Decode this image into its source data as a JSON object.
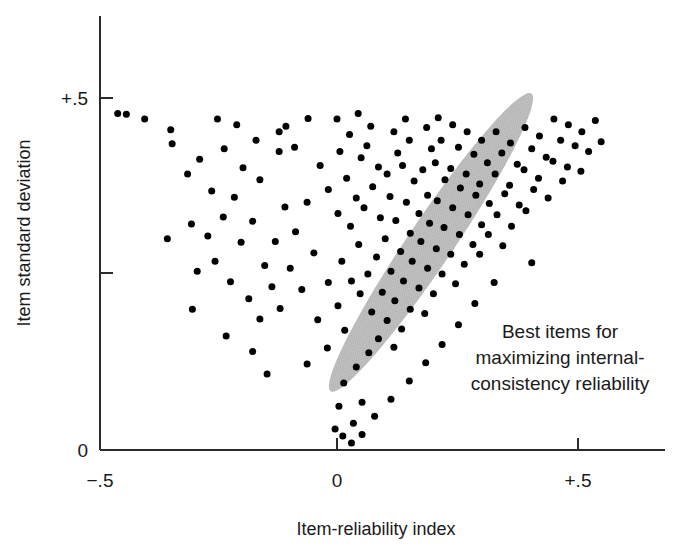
{
  "chart_data": {
    "type": "scatter",
    "title": "",
    "xlabel": "Item-reliability index",
    "ylabel": "Item standard deviation",
    "xlim": [
      -0.5,
      0.68
    ],
    "ylim": [
      0.0,
      0.59
    ],
    "x_ticks": [
      {
        "value": -0.5,
        "label": "−.5"
      },
      {
        "value": 0.0,
        "label": "0"
      },
      {
        "value": 0.5,
        "label": "+.5"
      }
    ],
    "y_ticks": [
      {
        "value": 0.0,
        "label": "0"
      },
      {
        "value": 0.25,
        "label": ""
      },
      {
        "value": 0.5,
        "label": "+.5"
      }
    ],
    "grid": false,
    "legend": null,
    "annotations": [
      {
        "name": "best-items-callout",
        "lines": [
          "Best items for",
          "maximizing internal-",
          "consistency reliability"
        ],
        "x": 0.47,
        "y": 0.165
      }
    ],
    "highlight_region": {
      "shape": "ellipse",
      "name": "best-items-ellipse",
      "fill": "#bdbdbd",
      "center_x": 0.195,
      "center_y": 0.295,
      "semi_major": 0.255,
      "semi_minor": 0.047,
      "rotation_deg": -56
    },
    "marker": {
      "shape": "circle",
      "color": "#000000",
      "size_px": 7
    },
    "points": [
      [
        -0.455,
        0.478
      ],
      [
        -0.437,
        0.477
      ],
      [
        -0.399,
        0.47
      ],
      [
        -0.345,
        0.455
      ],
      [
        -0.342,
        0.435
      ],
      [
        -0.285,
        0.413
      ],
      [
        -0.234,
        0.428
      ],
      [
        -0.195,
        0.401
      ],
      [
        -0.26,
        0.368
      ],
      [
        -0.213,
        0.359
      ],
      [
        -0.16,
        0.384
      ],
      [
        -0.12,
        0.424
      ],
      [
        -0.106,
        0.46
      ],
      [
        -0.088,
        0.43
      ],
      [
        -0.06,
        0.471
      ],
      [
        -0.302,
        0.321
      ],
      [
        -0.268,
        0.304
      ],
      [
        -0.236,
        0.331
      ],
      [
        -0.199,
        0.295
      ],
      [
        -0.175,
        0.325
      ],
      [
        -0.15,
        0.262
      ],
      [
        -0.128,
        0.296
      ],
      [
        -0.108,
        0.345
      ],
      [
        -0.086,
        0.31
      ],
      [
        -0.062,
        0.352
      ],
      [
        -0.29,
        0.254
      ],
      [
        -0.253,
        0.268
      ],
      [
        -0.221,
        0.239
      ],
      [
        -0.183,
        0.215
      ],
      [
        -0.16,
        0.186
      ],
      [
        -0.135,
        0.232
      ],
      [
        -0.118,
        0.201
      ],
      [
        -0.097,
        0.258
      ],
      [
        -0.073,
        0.228
      ],
      [
        -0.048,
        0.28
      ],
      [
        -0.04,
        0.185
      ],
      [
        -0.02,
        0.145
      ],
      [
        -0.062,
        0.122
      ],
      [
        -0.018,
        0.238
      ],
      [
        0.002,
        0.205
      ],
      [
        0.016,
        0.17
      ],
      [
        0.01,
        0.268
      ],
      [
        0.03,
        0.24
      ],
      [
        0.045,
        0.292
      ],
      [
        0.028,
        0.318
      ],
      [
        0.002,
        0.336
      ],
      [
        -0.018,
        0.37
      ],
      [
        -0.035,
        0.404
      ],
      [
        0.02,
        0.386
      ],
      [
        0.04,
        0.358
      ],
      [
        0.006,
        0.424
      ],
      [
        0.026,
        0.448
      ],
      [
        0.05,
        0.415
      ],
      [
        0.0,
        0.47
      ],
      [
        0.044,
        0.478
      ],
      [
        0.07,
        0.46
      ],
      [
        0.062,
        0.432
      ],
      [
        0.086,
        0.402
      ],
      [
        0.074,
        0.374
      ],
      [
        0.056,
        0.344
      ],
      [
        0.09,
        0.33
      ],
      [
        0.11,
        0.36
      ],
      [
        0.104,
        0.392
      ],
      [
        0.126,
        0.422
      ],
      [
        0.118,
        0.452
      ],
      [
        0.142,
        0.47
      ],
      [
        0.15,
        0.44
      ],
      [
        0.136,
        0.404
      ],
      [
        0.16,
        0.382
      ],
      [
        0.144,
        0.352
      ],
      [
        0.122,
        0.326
      ],
      [
        0.1,
        0.3
      ],
      [
        0.082,
        0.274
      ],
      [
        0.064,
        0.25
      ],
      [
        0.048,
        0.222
      ],
      [
        0.072,
        0.196
      ],
      [
        0.094,
        0.224
      ],
      [
        0.112,
        0.254
      ],
      [
        0.132,
        0.282
      ],
      [
        0.152,
        0.308
      ],
      [
        0.17,
        0.336
      ],
      [
        0.188,
        0.362
      ],
      [
        0.178,
        0.398
      ],
      [
        0.196,
        0.428
      ],
      [
        0.186,
        0.458
      ],
      [
        0.21,
        0.472
      ],
      [
        0.216,
        0.44
      ],
      [
        0.204,
        0.408
      ],
      [
        0.224,
        0.384
      ],
      [
        0.208,
        0.354
      ],
      [
        0.192,
        0.322
      ],
      [
        0.174,
        0.296
      ],
      [
        0.156,
        0.268
      ],
      [
        0.138,
        0.24
      ],
      [
        0.12,
        0.212
      ],
      [
        0.104,
        0.184
      ],
      [
        0.086,
        0.158
      ],
      [
        0.066,
        0.138
      ],
      [
        0.04,
        0.118
      ],
      [
        0.014,
        0.095
      ],
      [
        0.004,
        0.062
      ],
      [
        -0.004,
        0.03
      ],
      [
        0.012,
        0.02
      ],
      [
        0.034,
        0.038
      ],
      [
        0.052,
        0.068
      ],
      [
        0.24,
        0.462
      ],
      [
        0.252,
        0.43
      ],
      [
        0.236,
        0.4
      ],
      [
        0.256,
        0.372
      ],
      [
        0.24,
        0.344
      ],
      [
        0.222,
        0.316
      ],
      [
        0.206,
        0.286
      ],
      [
        0.188,
        0.258
      ],
      [
        0.17,
        0.23
      ],
      [
        0.152,
        0.2
      ],
      [
        0.134,
        0.172
      ],
      [
        0.118,
        0.146
      ],
      [
        0.27,
        0.452
      ],
      [
        0.284,
        0.42
      ],
      [
        0.268,
        0.392
      ],
      [
        0.288,
        0.362
      ],
      [
        0.272,
        0.334
      ],
      [
        0.254,
        0.306
      ],
      [
        0.236,
        0.278
      ],
      [
        0.218,
        0.25
      ],
      [
        0.2,
        0.222
      ],
      [
        0.182,
        0.194
      ],
      [
        0.3,
        0.44
      ],
      [
        0.312,
        0.408
      ],
      [
        0.296,
        0.378
      ],
      [
        0.316,
        0.35
      ],
      [
        0.3,
        0.32
      ],
      [
        0.282,
        0.292
      ],
      [
        0.264,
        0.264
      ],
      [
        0.246,
        0.236
      ],
      [
        0.33,
        0.452
      ],
      [
        0.342,
        0.422
      ],
      [
        0.328,
        0.392
      ],
      [
        0.348,
        0.364
      ],
      [
        0.332,
        0.334
      ],
      [
        0.314,
        0.306
      ],
      [
        0.296,
        0.278
      ],
      [
        0.36,
        0.436
      ],
      [
        0.374,
        0.406
      ],
      [
        0.358,
        0.376
      ],
      [
        0.378,
        0.348
      ],
      [
        0.362,
        0.318
      ],
      [
        0.344,
        0.29
      ],
      [
        0.39,
        0.458
      ],
      [
        0.404,
        0.428
      ],
      [
        0.388,
        0.398
      ],
      [
        0.408,
        0.37
      ],
      [
        0.392,
        0.34
      ],
      [
        0.42,
        0.446
      ],
      [
        0.434,
        0.416
      ],
      [
        0.418,
        0.386
      ],
      [
        0.438,
        0.358
      ],
      [
        0.45,
        0.47
      ],
      [
        0.464,
        0.44
      ],
      [
        0.448,
        0.41
      ],
      [
        0.468,
        0.382
      ],
      [
        0.48,
        0.462
      ],
      [
        0.494,
        0.432
      ],
      [
        0.478,
        0.402
      ],
      [
        0.508,
        0.452
      ],
      [
        0.522,
        0.424
      ],
      [
        0.506,
        0.396
      ],
      [
        0.536,
        0.468
      ],
      [
        0.548,
        0.438
      ],
      [
        0.404,
        0.266
      ],
      [
        0.326,
        0.238
      ],
      [
        0.286,
        0.208
      ],
      [
        0.252,
        0.178
      ],
      [
        0.218,
        0.15
      ],
      [
        0.184,
        0.124
      ],
      [
        0.15,
        0.098
      ],
      [
        0.112,
        0.072
      ],
      [
        0.078,
        0.048
      ],
      [
        0.052,
        0.022
      ],
      [
        0.03,
        0.01
      ],
      [
        -0.12,
        0.452
      ],
      [
        -0.168,
        0.44
      ],
      [
        -0.208,
        0.462
      ],
      [
        -0.248,
        0.47
      ],
      [
        -0.31,
        0.392
      ],
      [
        -0.352,
        0.3
      ],
      [
        -0.3,
        0.2
      ],
      [
        -0.23,
        0.162
      ],
      [
        -0.175,
        0.14
      ],
      [
        -0.145,
        0.108
      ]
    ]
  },
  "figure": {
    "background": "#ffffff",
    "axis_color": "#2b2b2b",
    "marker_color": "#000000",
    "ellipse_color": "#bdbdbd"
  }
}
